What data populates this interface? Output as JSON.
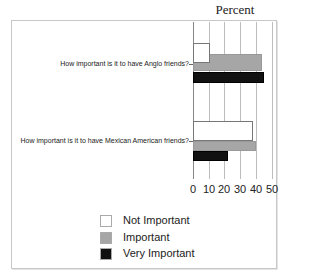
{
  "chart_data": {
    "type": "bar",
    "orientation": "horizontal",
    "title": "Percent",
    "xlabel": "",
    "ylabel": "",
    "xlim": [
      0,
      50
    ],
    "x_ticks": [
      "0",
      "10",
      "20",
      "30",
      "40",
      "50"
    ],
    "grid": true,
    "legend_position": "bottom",
    "categories": [
      "How important is it to have Anglo friends?",
      "How important is it to have Mexican American friends?"
    ],
    "series": [
      {
        "name": "Not Important",
        "color": "#ffffff",
        "values": [
          11,
          38
        ]
      },
      {
        "name": "Important",
        "color": "#a6a6a6",
        "values": [
          44,
          40
        ]
      },
      {
        "name": "Very Important",
        "color": "#111111",
        "values": [
          45,
          22
        ]
      }
    ]
  }
}
